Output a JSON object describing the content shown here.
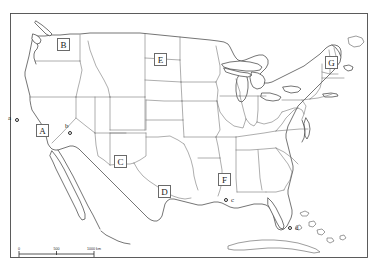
{
  "map": {
    "title": "United States outline map with lettered state labels and city markers",
    "frame": {
      "x": 10,
      "y": 13,
      "width": 358,
      "height": 245
    },
    "background_color": "#ffffff",
    "outline_color": "#3a3a3a",
    "state_border_color": "#6b6b6b",
    "label_text_color": "#1a1a1a"
  },
  "state_labels": [
    {
      "letter": "B",
      "x": 57,
      "y": 38
    },
    {
      "letter": "E",
      "x": 154,
      "y": 53
    },
    {
      "letter": "G",
      "x": 325,
      "y": 56
    },
    {
      "letter": "A",
      "x": 36,
      "y": 124
    },
    {
      "letter": "C",
      "x": 114,
      "y": 155
    },
    {
      "letter": "D",
      "x": 158,
      "y": 185
    },
    {
      "letter": "F",
      "x": 218,
      "y": 173
    }
  ],
  "city_markers": [
    {
      "letter": "a",
      "dot_x": 15,
      "dot_y": 118,
      "label_x": 8,
      "label_y": 115
    },
    {
      "letter": "b",
      "dot_x": 68,
      "dot_y": 131,
      "label_x": 64,
      "label_y": 124
    },
    {
      "letter": "c",
      "dot_x": 224,
      "dot_y": 198,
      "label_x": 230,
      "label_y": 198
    },
    {
      "letter": "d",
      "dot_x": 288,
      "dot_y": 226,
      "label_x": 294,
      "label_y": 226
    }
  ],
  "scale_bar": {
    "left_label": "0",
    "mid_label": "500",
    "right_label": "1000 km",
    "segments": 2
  }
}
